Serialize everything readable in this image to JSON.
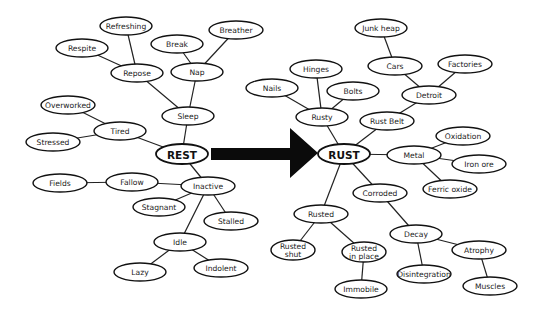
{
  "diagram": {
    "type": "mind-map",
    "arrow": {
      "from": "REST",
      "to": "RUST",
      "color": "#0b0b0b"
    },
    "nodes": [
      {
        "id": "rest",
        "label": "REST",
        "x": 182,
        "y": 154,
        "rx": 26,
        "ry": 10,
        "main": true
      },
      {
        "id": "sleep",
        "label": "Sleep",
        "x": 188,
        "y": 116,
        "rx": 26,
        "ry": 9
      },
      {
        "id": "repose",
        "label": "Repose",
        "x": 137,
        "y": 73,
        "rx": 26,
        "ry": 9
      },
      {
        "id": "nap",
        "label": "Nap",
        "x": 197,
        "y": 72,
        "rx": 26,
        "ry": 9
      },
      {
        "id": "refreshing",
        "label": "Refreshing",
        "x": 126,
        "y": 26,
        "rx": 26,
        "ry": 9
      },
      {
        "id": "respite",
        "label": "Respite",
        "x": 82,
        "y": 48,
        "rx": 26,
        "ry": 9
      },
      {
        "id": "break",
        "label": "Break",
        "x": 177,
        "y": 44,
        "rx": 26,
        "ry": 9
      },
      {
        "id": "breather",
        "label": "Breather",
        "x": 236,
        "y": 30,
        "rx": 27,
        "ry": 9
      },
      {
        "id": "tired",
        "label": "Tired",
        "x": 120,
        "y": 131,
        "rx": 26,
        "ry": 9
      },
      {
        "id": "overworked",
        "label": "Overworked",
        "x": 68,
        "y": 105,
        "rx": 27,
        "ry": 9
      },
      {
        "id": "stressed",
        "label": "Stressed",
        "x": 53,
        "y": 142,
        "rx": 27,
        "ry": 9
      },
      {
        "id": "inactive",
        "label": "Inactive",
        "x": 208,
        "y": 186,
        "rx": 27,
        "ry": 9
      },
      {
        "id": "fallow",
        "label": "Fallow",
        "x": 132,
        "y": 182,
        "rx": 26,
        "ry": 9
      },
      {
        "id": "fields",
        "label": "Fields",
        "x": 60,
        "y": 183,
        "rx": 27,
        "ry": 9
      },
      {
        "id": "stagnant",
        "label": "Stagnant",
        "x": 159,
        "y": 207,
        "rx": 26,
        "ry": 9
      },
      {
        "id": "stalled",
        "label": "Stalled",
        "x": 231,
        "y": 221,
        "rx": 27,
        "ry": 9
      },
      {
        "id": "idle",
        "label": "Idle",
        "x": 180,
        "y": 242,
        "rx": 26,
        "ry": 9
      },
      {
        "id": "lazy",
        "label": "Lazy",
        "x": 140,
        "y": 272,
        "rx": 26,
        "ry": 9
      },
      {
        "id": "indolent",
        "label": "Indolent",
        "x": 221,
        "y": 268,
        "rx": 27,
        "ry": 9
      },
      {
        "id": "rust",
        "label": "RUST",
        "x": 344,
        "y": 154,
        "rx": 26,
        "ry": 10,
        "main": true
      },
      {
        "id": "rusty",
        "label": "Rusty",
        "x": 322,
        "y": 117,
        "rx": 26,
        "ry": 9
      },
      {
        "id": "hinges",
        "label": "Hinges",
        "x": 316,
        "y": 69,
        "rx": 26,
        "ry": 9
      },
      {
        "id": "nails",
        "label": "Nails",
        "x": 272,
        "y": 88,
        "rx": 26,
        "ry": 9
      },
      {
        "id": "bolts",
        "label": "Bolts",
        "x": 353,
        "y": 91,
        "rx": 26,
        "ry": 9
      },
      {
        "id": "rust_belt",
        "label": "Rust Belt",
        "x": 387,
        "y": 121,
        "rx": 27,
        "ry": 9
      },
      {
        "id": "detroit",
        "label": "Detroit",
        "x": 429,
        "y": 95,
        "rx": 27,
        "ry": 9
      },
      {
        "id": "cars",
        "label": "Cars",
        "x": 395,
        "y": 66,
        "rx": 27,
        "ry": 9
      },
      {
        "id": "junk_heap",
        "label": "Junk heap",
        "x": 381,
        "y": 28,
        "rx": 26,
        "ry": 9
      },
      {
        "id": "factories",
        "label": "Factories",
        "x": 465,
        "y": 64,
        "rx": 27,
        "ry": 9
      },
      {
        "id": "metal",
        "label": "Metal",
        "x": 414,
        "y": 155,
        "rx": 27,
        "ry": 9
      },
      {
        "id": "oxidation",
        "label": "Oxidation",
        "x": 463,
        "y": 136,
        "rx": 27,
        "ry": 9
      },
      {
        "id": "iron_ore",
        "label": "Iron ore",
        "x": 479,
        "y": 164,
        "rx": 27,
        "ry": 9
      },
      {
        "id": "ferric_oxide",
        "label": "Ferric oxide",
        "x": 450,
        "y": 189,
        "rx": 27,
        "ry": 9
      },
      {
        "id": "corroded",
        "label": "Corroded",
        "x": 380,
        "y": 193,
        "rx": 27,
        "ry": 9
      },
      {
        "id": "rusted",
        "label": "Rusted",
        "x": 321,
        "y": 214,
        "rx": 27,
        "ry": 9
      },
      {
        "id": "rusted_shut",
        "label": "Rusted shut",
        "x": 293,
        "y": 250,
        "rx": 22,
        "ry": 10,
        "lines": [
          "Rusted",
          "shut"
        ]
      },
      {
        "id": "rusted_in_place",
        "label": "Rusted in place",
        "x": 364,
        "y": 252,
        "rx": 22,
        "ry": 10,
        "lines": [
          "Rusted",
          "in place"
        ]
      },
      {
        "id": "immobile",
        "label": "Immobile",
        "x": 361,
        "y": 289,
        "rx": 26,
        "ry": 9
      },
      {
        "id": "decay",
        "label": "Decay",
        "x": 416,
        "y": 234,
        "rx": 26,
        "ry": 9
      },
      {
        "id": "disintegration",
        "label": "Disintegration",
        "x": 424,
        "y": 274,
        "rx": 27,
        "ry": 9
      },
      {
        "id": "atrophy",
        "label": "Atrophy",
        "x": 479,
        "y": 250,
        "rx": 27,
        "ry": 9
      },
      {
        "id": "muscles",
        "label": "Muscles",
        "x": 490,
        "y": 286,
        "rx": 27,
        "ry": 9
      }
    ],
    "edges": [
      [
        "rest",
        "sleep"
      ],
      [
        "sleep",
        "repose"
      ],
      [
        "sleep",
        "nap"
      ],
      [
        "repose",
        "refreshing"
      ],
      [
        "repose",
        "respite"
      ],
      [
        "nap",
        "break"
      ],
      [
        "nap",
        "breather"
      ],
      [
        "rest",
        "tired"
      ],
      [
        "tired",
        "overworked"
      ],
      [
        "tired",
        "stressed"
      ],
      [
        "rest",
        "inactive"
      ],
      [
        "inactive",
        "fallow"
      ],
      [
        "fallow",
        "fields"
      ],
      [
        "inactive",
        "stagnant"
      ],
      [
        "inactive",
        "stalled"
      ],
      [
        "inactive",
        "idle"
      ],
      [
        "idle",
        "lazy"
      ],
      [
        "idle",
        "indolent"
      ],
      [
        "rust",
        "rusty"
      ],
      [
        "rusty",
        "hinges"
      ],
      [
        "rusty",
        "nails"
      ],
      [
        "rusty",
        "bolts"
      ],
      [
        "rust",
        "rust_belt"
      ],
      [
        "rust_belt",
        "detroit"
      ],
      [
        "detroit",
        "cars"
      ],
      [
        "cars",
        "junk_heap"
      ],
      [
        "detroit",
        "factories"
      ],
      [
        "rust",
        "metal"
      ],
      [
        "metal",
        "oxidation"
      ],
      [
        "metal",
        "iron_ore"
      ],
      [
        "metal",
        "ferric_oxide"
      ],
      [
        "rust",
        "corroded"
      ],
      [
        "corroded",
        "decay"
      ],
      [
        "decay",
        "disintegration"
      ],
      [
        "decay",
        "atrophy"
      ],
      [
        "atrophy",
        "muscles"
      ],
      [
        "rust",
        "rusted"
      ],
      [
        "rusted",
        "rusted_shut"
      ],
      [
        "rusted",
        "rusted_in_place"
      ],
      [
        "rusted_in_place",
        "immobile"
      ]
    ]
  }
}
